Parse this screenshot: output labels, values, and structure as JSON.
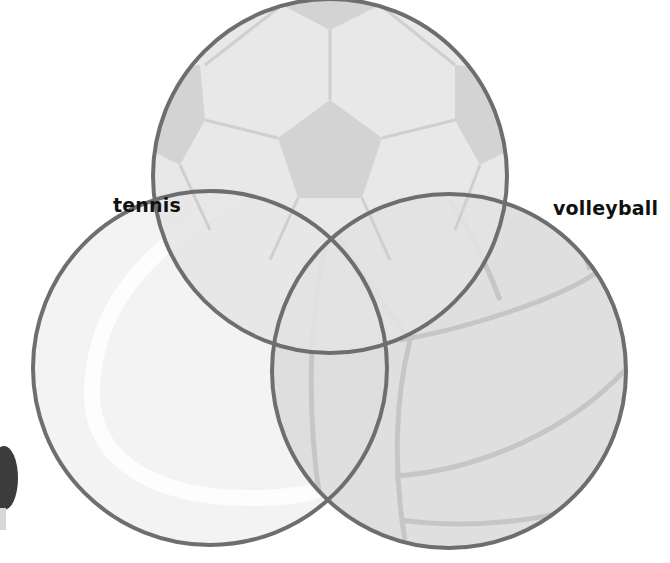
{
  "diagram": {
    "type": "venn",
    "sets": [
      {
        "id": "soccer",
        "label": "",
        "texture": "soccer-ball"
      },
      {
        "id": "tennis",
        "label": "tennis",
        "texture": "tennis-ball"
      },
      {
        "id": "volleyball",
        "label": "volleyball",
        "texture": "volleyball"
      }
    ],
    "labels": {
      "tennis": "tennis",
      "volleyball": "volleyball"
    },
    "colors": {
      "outline": "#6e6e6e",
      "soccer_fill": "#e2e2e2",
      "soccer_patch": "#d2d2d2",
      "tennis_fill": "#f3f3f3",
      "tennis_seam": "#fbfbfb",
      "volleyball_fill": "#dcdcdc",
      "volleyball_seam": "#c8c8c8",
      "partial_object": "#3c3c3c"
    }
  }
}
